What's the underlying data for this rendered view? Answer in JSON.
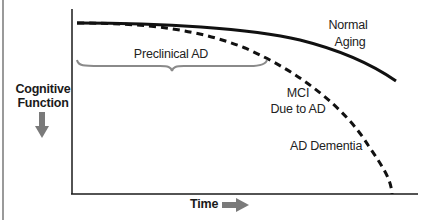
{
  "diagram": {
    "y_axis_label_line1": "Cognitive",
    "y_axis_label_line2": "Function",
    "y_axis_arrow": "down-arrow-icon",
    "x_axis_label": "Time",
    "x_axis_arrow": "right-arrow-icon",
    "curves": [
      {
        "name": "Normal Aging",
        "style": "solid",
        "color": "#111111"
      },
      {
        "name": "Alzheimer's Disease progression",
        "style": "dashed",
        "color": "#111111"
      }
    ],
    "labels": {
      "normal_line1": "Normal",
      "normal_line2": "Aging",
      "preclinical": "Preclinical AD",
      "mci_line1": "MCI",
      "mci_line2": "Due to AD",
      "dementia": "AD Dementia"
    },
    "colors": {
      "axis": "#1a1a1a",
      "curve": "#111111",
      "brace": "#8a8a8a",
      "arrow": "#7a7a7a",
      "text": "#222222"
    }
  }
}
